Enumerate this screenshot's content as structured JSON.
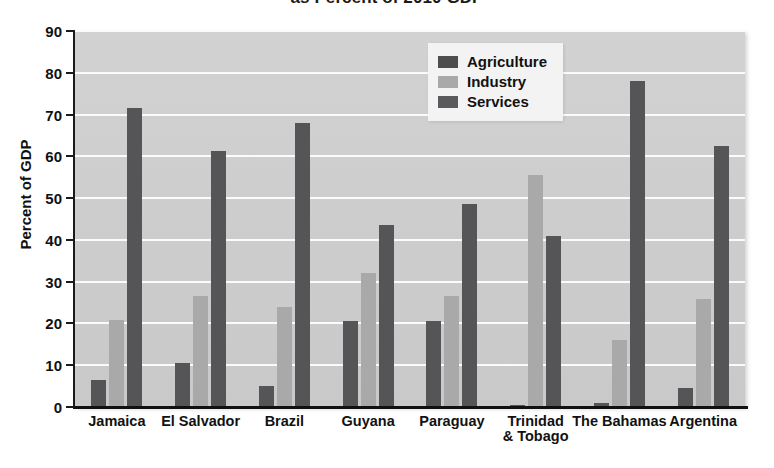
{
  "chart_data": {
    "type": "bar",
    "title": "as Percent of 2010 GDP",
    "xlabel": "",
    "ylabel": "Percent of GDP",
    "ylim": [
      0,
      90
    ],
    "ytick_step": 10,
    "yticks": [
      "0",
      "10",
      "20",
      "30",
      "40",
      "50",
      "60",
      "70",
      "80",
      "90"
    ],
    "grid": true,
    "legend_position": "inside-top-center",
    "categories": [
      "Jamaica",
      "El Salvador",
      "Brazil",
      "Guyana",
      "Paraguay",
      "Trinidad\n& Tobago",
      "The Bahamas",
      "Argentina"
    ],
    "series": [
      {
        "name": "Agriculture",
        "color": "#555557",
        "values": [
          6.5,
          10.5,
          5.0,
          20.5,
          20.5,
          0.5,
          1.0,
          4.5
        ]
      },
      {
        "name": "Industry",
        "color": "#a9a9a9",
        "values": [
          20.8,
          26.5,
          24.0,
          32.0,
          26.5,
          55.5,
          16.0,
          25.8
        ]
      },
      {
        "name": "Services",
        "color": "#555557",
        "values": [
          71.5,
          61.3,
          68.0,
          43.5,
          48.5,
          41.0,
          78.0,
          62.5
        ]
      }
    ]
  },
  "legend": {
    "items": [
      {
        "label": "Agriculture"
      },
      {
        "label": "Industry"
      },
      {
        "label": "Services"
      }
    ]
  },
  "colors": {
    "plot_background": "#cdcdcd",
    "gridline": "#fbfbfb",
    "axis": "#111111",
    "agriculture": "#555557",
    "industry": "#a9a9a9",
    "services": "#555557"
  }
}
